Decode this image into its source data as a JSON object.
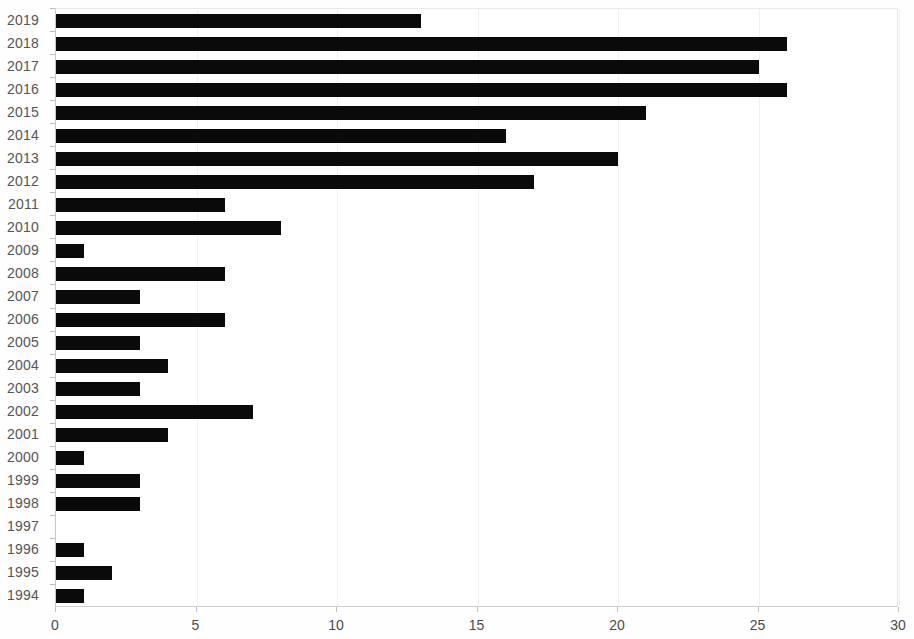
{
  "chart_data": {
    "type": "bar",
    "orientation": "horizontal",
    "title": "",
    "subtitle": "",
    "xlabel": "",
    "ylabel": "",
    "xlim": [
      0,
      30
    ],
    "xticks": [
      0,
      5,
      10,
      15,
      20,
      25,
      30
    ],
    "xtick_labels": [
      "0",
      "5",
      "10",
      "15",
      "20",
      "25",
      "30"
    ],
    "grid": true,
    "grid_axis": "x",
    "legend": null,
    "bar_color": "#0a0a0a",
    "categories": [
      "2019",
      "2018",
      "2017",
      "2016",
      "2015",
      "2014",
      "2013",
      "2012",
      "2011",
      "2010",
      "2009",
      "2008",
      "2007",
      "2006",
      "2005",
      "2004",
      "2003",
      "2002",
      "2001",
      "2000",
      "1999",
      "1998",
      "1997",
      "1996",
      "1995",
      "1994"
    ],
    "values": [
      13,
      26,
      25,
      26,
      21,
      16,
      20,
      17,
      6,
      8,
      1,
      6,
      3,
      6,
      3,
      4,
      3,
      7,
      4,
      1,
      3,
      3,
      0,
      1,
      2,
      1
    ]
  }
}
